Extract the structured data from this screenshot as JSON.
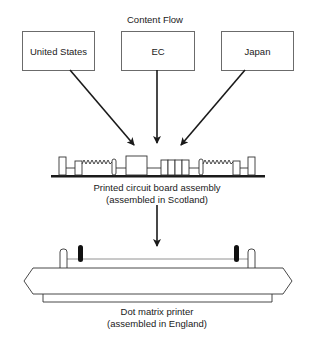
{
  "title": "Content Flow",
  "sources": [
    {
      "label": "United States"
    },
    {
      "label": "EC"
    },
    {
      "label": "Japan"
    }
  ],
  "pcb": {
    "line1": "Printed circuit board assembly",
    "line2": "(assembled in Scotland)"
  },
  "printer": {
    "line1": "Dot matrix printer",
    "line2": "(assembled in England)"
  },
  "colors": {
    "stroke": "#1a1a1a",
    "box_border": "#6b6b6b",
    "background": "#ffffff"
  }
}
